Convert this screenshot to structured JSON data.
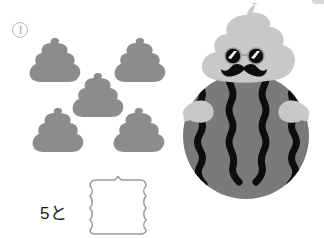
{
  "problem": {
    "number_label": "Ⅰ",
    "equation_prefix": "5と",
    "answer_value": "",
    "poop_count": 5
  },
  "icons": {
    "poop": "poop-icon",
    "character": "poop-watermelon-character-icon",
    "answer_box": "scalloped-answer-box"
  },
  "colors": {
    "poop_gray": "#8c8c8c",
    "head_light_gray": "#c8c8c8",
    "melon_gray": "#7a7a7a",
    "stripe_black": "#0d0d0d",
    "box_border": "#9a9a9a",
    "text": "#1a1a1a"
  }
}
